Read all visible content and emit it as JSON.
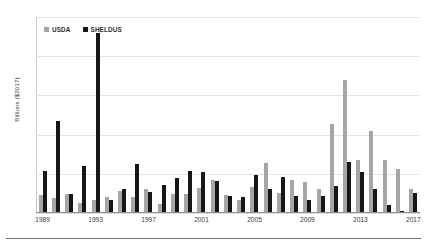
{
  "chart_data": {
    "type": "bar",
    "title": "",
    "xlabel": "",
    "ylabel": "Billions ($2017)",
    "ylim": [
      0,
      25
    ],
    "ytick_values": [
      0,
      5,
      10,
      15,
      20,
      25
    ],
    "ytick_labels": [
      "0",
      "5",
      "10",
      "15",
      "20",
      "25"
    ],
    "grid": true,
    "legend_position": "top-left",
    "xtick_labels": [
      "1989",
      "1993",
      "1997",
      "2001",
      "2005",
      "2009",
      "2013",
      "2017"
    ],
    "categories": [
      "1989",
      "1990",
      "1991",
      "1992",
      "1993",
      "1994",
      "1995",
      "1996",
      "1997",
      "1998",
      "1999",
      "2000",
      "2001",
      "2002",
      "2003",
      "2004",
      "2005",
      "2006",
      "2007",
      "2008",
      "2009",
      "2010",
      "2011",
      "2012",
      "2013",
      "2014",
      "2015",
      "2016",
      "2017"
    ],
    "series": [
      {
        "name": "USDA",
        "color": "#a6a6a6",
        "values": [
          2.3,
          1.9,
          2.4,
          1.3,
          1.6,
          2.1,
          2.8,
          2.1,
          3.0,
          1.1,
          2.4,
          2.4,
          3.2,
          4.2,
          2.3,
          1.6,
          3.3,
          6.4,
          2.5,
          4.2,
          4.0,
          3.0,
          11.3,
          17.0,
          6.7,
          10.5,
          6.7,
          5.6,
          3.0
        ]
      },
      {
        "name": "SHELDUS",
        "color": "#161616",
        "values": [
          5.3,
          11.7,
          2.4,
          6.0,
          22.9,
          1.7,
          3.0,
          6.2,
          2.7,
          3.6,
          4.5,
          5.4,
          5.2,
          4.1,
          2.2,
          2.0,
          4.8,
          3.0,
          4.6,
          2.2,
          1.6,
          2.2,
          3.4,
          6.5,
          5.2,
          3.1,
          1.0,
          0.3,
          2.6
        ]
      }
    ]
  },
  "legend": {
    "items": [
      {
        "label": "USDA"
      },
      {
        "label": "SHELDUS"
      }
    ]
  }
}
